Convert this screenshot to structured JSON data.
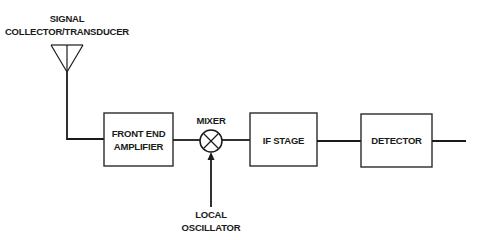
{
  "diagram": {
    "type": "block-diagram",
    "antenna": {
      "label_line1": "SIGNAL",
      "label_line2": "COLLECTOR/TRANSDUCER"
    },
    "blocks": [
      {
        "id": "front-end",
        "line1": "FRONT END",
        "line2": "AMPLIFIER"
      },
      {
        "id": "if-stage",
        "line1": "IF STAGE"
      },
      {
        "id": "detector",
        "line1": "DETECTOR"
      }
    ],
    "mixer": {
      "label": "MIXER",
      "symbol": "circle-x"
    },
    "oscillator": {
      "label_line1": "LOCAL",
      "label_line2": "OSCILLATOR"
    },
    "signal_flow": [
      "SIGNAL COLLECTOR/TRANSDUCER",
      "FRONT END AMPLIFIER",
      "MIXER",
      "IF STAGE",
      "DETECTOR",
      "output"
    ],
    "colors": {
      "stroke": "#1a1a1a",
      "background": "#ffffff"
    }
  }
}
